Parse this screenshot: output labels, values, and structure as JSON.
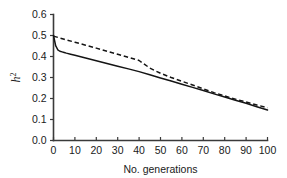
{
  "chart_data": {
    "type": "line",
    "title": "",
    "xlabel": "No. generations",
    "ylabel": "h2",
    "ylabel_base": "h",
    "ylabel_exponent": "2",
    "xlim": [
      0,
      100
    ],
    "ylim": [
      0,
      0.6
    ],
    "xticks": [
      0,
      10,
      20,
      30,
      40,
      50,
      60,
      70,
      80,
      90,
      100
    ],
    "yticks": [
      0.0,
      0.1,
      0.2,
      0.3,
      0.4,
      0.5,
      0.6
    ],
    "xtick_labels": [
      "0",
      "10",
      "20",
      "30",
      "40",
      "50",
      "60",
      "70",
      "80",
      "90",
      "100"
    ],
    "ytick_labels": [
      "0.0",
      "0.1",
      "0.2",
      "0.3",
      "0.4",
      "0.5",
      "0.6"
    ],
    "grid": false,
    "legend": false,
    "legend_position": "none",
    "series": [
      {
        "name": "solid",
        "style": "solid",
        "color": "#141414",
        "x": [
          0,
          1,
          2,
          3,
          4,
          5,
          6,
          8,
          10,
          15,
          20,
          25,
          30,
          35,
          40,
          45,
          50,
          55,
          60,
          65,
          70,
          75,
          80,
          85,
          90,
          95,
          100
        ],
        "values": [
          0.5,
          0.452,
          0.432,
          0.425,
          0.422,
          0.419,
          0.416,
          0.411,
          0.406,
          0.393,
          0.38,
          0.367,
          0.354,
          0.341,
          0.328,
          0.313,
          0.298,
          0.283,
          0.268,
          0.253,
          0.238,
          0.222,
          0.207,
          0.192,
          0.177,
          0.161,
          0.145
        ]
      },
      {
        "name": "dashed",
        "style": "dashed",
        "color": "#141414",
        "x": [
          0,
          5,
          10,
          15,
          20,
          25,
          30,
          35,
          40,
          45,
          50,
          55,
          60,
          65,
          70,
          75,
          80,
          85,
          90,
          95,
          100
        ],
        "values": [
          0.497,
          0.482,
          0.468,
          0.454,
          0.44,
          0.425,
          0.411,
          0.396,
          0.381,
          0.345,
          0.32,
          0.3,
          0.282,
          0.264,
          0.246,
          0.228,
          0.212,
          0.197,
          0.183,
          0.169,
          0.156
        ]
      }
    ]
  }
}
